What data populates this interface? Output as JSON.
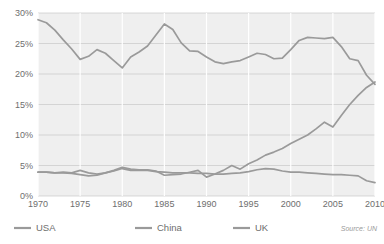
{
  "chart_data": {
    "type": "line",
    "title": "",
    "subtitle": "",
    "xlabel": "",
    "ylabel": "",
    "xlim": [
      1970,
      2010
    ],
    "ylim": [
      0,
      30
    ],
    "grid": true,
    "legend_position": "bottom-left",
    "source": "Source: UN",
    "y_ticks": [
      "0%",
      "5%",
      "10%",
      "15%",
      "20%",
      "25%",
      "30%"
    ],
    "y_tick_values": [
      0,
      5,
      10,
      15,
      20,
      25,
      30
    ],
    "x_ticks": [
      "1970",
      "1975",
      "1980",
      "1985",
      "1990",
      "1995",
      "2000",
      "2005",
      "2010"
    ],
    "x_tick_values": [
      1970,
      1975,
      1980,
      1985,
      1990,
      1995,
      2000,
      2005,
      2010
    ],
    "x": [
      1970,
      1971,
      1972,
      1973,
      1974,
      1975,
      1976,
      1977,
      1978,
      1979,
      1980,
      1981,
      1982,
      1983,
      1984,
      1985,
      1986,
      1987,
      1988,
      1989,
      1990,
      1991,
      1992,
      1993,
      1994,
      1995,
      1996,
      1997,
      1998,
      1999,
      2000,
      2001,
      2002,
      2003,
      2004,
      2005,
      2006,
      2007,
      2008,
      2009,
      2010
    ],
    "series": [
      {
        "name": "USA",
        "color": "#9a9a9a",
        "values": [
          28.9,
          28.4,
          27.2,
          25.6,
          24.1,
          22.4,
          22.9,
          24.0,
          23.4,
          22.2,
          21.0,
          22.8,
          23.6,
          24.6,
          26.4,
          28.2,
          27.3,
          25.1,
          23.8,
          23.7,
          22.8,
          22.0,
          21.7,
          22.0,
          22.2,
          22.8,
          23.4,
          23.2,
          22.5,
          22.6,
          24.0,
          25.5,
          26.0,
          25.9,
          25.8,
          26.0,
          24.5,
          22.5,
          22.2,
          19.8,
          18.3
        ]
      },
      {
        "name": "China",
        "color": "#9a9a9a",
        "values": [
          3.9,
          3.9,
          3.8,
          3.8,
          3.7,
          3.5,
          3.3,
          3.4,
          3.8,
          4.2,
          4.7,
          4.4,
          4.3,
          4.3,
          4.1,
          3.4,
          3.5,
          3.6,
          3.9,
          4.2,
          3.1,
          3.6,
          4.2,
          5.0,
          4.4,
          5.3,
          5.9,
          6.7,
          7.2,
          7.8,
          8.6,
          9.3,
          10.0,
          11.0,
          12.1,
          11.3,
          13.2,
          15.0,
          16.5,
          17.8,
          18.7
        ]
      },
      {
        "name": "UK",
        "color": "#9a9a9a",
        "values": [
          3.9,
          3.9,
          3.8,
          3.9,
          3.8,
          4.2,
          3.8,
          3.6,
          3.8,
          4.1,
          4.5,
          4.2,
          4.2,
          4.2,
          4.0,
          3.9,
          3.8,
          3.8,
          3.8,
          3.7,
          3.7,
          3.6,
          3.6,
          3.7,
          3.8,
          4.0,
          4.3,
          4.5,
          4.4,
          4.1,
          3.9,
          3.9,
          3.8,
          3.7,
          3.6,
          3.5,
          3.5,
          3.4,
          3.3,
          2.5,
          2.2
        ]
      }
    ]
  },
  "legend": {
    "items": [
      {
        "label": "USA"
      },
      {
        "label": "China"
      },
      {
        "label": "UK"
      }
    ]
  },
  "footer": {
    "source": "Source: UN"
  },
  "colors": {
    "line": "#9a9a9a",
    "plot_background": "#efefef",
    "hgrid": "#c9c9c9",
    "vgrid": "#ffffff",
    "axis_text": "#6e6e6e",
    "source_text": "#9a9a9a"
  }
}
